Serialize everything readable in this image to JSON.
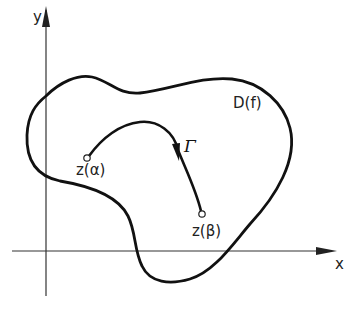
{
  "diagram": {
    "axes": {
      "x_label": "x",
      "y_label": "y",
      "color": "#333333"
    },
    "region": {
      "label": "D(f)",
      "stroke": "#111111"
    },
    "curve": {
      "label": "Γ",
      "stroke": "#111111",
      "start_point_label": "z(α)",
      "end_point_label": "z(β)"
    }
  }
}
